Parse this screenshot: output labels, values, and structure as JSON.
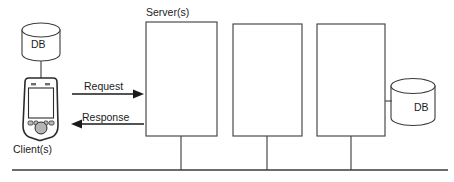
{
  "diagram": {
    "labels": {
      "servers": "Server(s)",
      "clients": "Client(s)",
      "db_left": "DB",
      "db_right": "DB",
      "request": "Request",
      "response": "Response"
    },
    "colors": {
      "stroke": "#3b3b3b",
      "arrow": "#1a1a1a",
      "background": "#ffffff",
      "device_fill": "#ffffff",
      "button_fill": "#b9b9b9"
    },
    "nodes": [
      {
        "id": "db-left",
        "kind": "database",
        "label": "DB",
        "x": 22,
        "y": 20,
        "width": 38,
        "height": 44
      },
      {
        "id": "client",
        "kind": "pda",
        "label": "Client(s)",
        "x": 21,
        "y": 78,
        "width": 40,
        "height": 62
      },
      {
        "id": "server-1",
        "kind": "box",
        "label": "",
        "x": 146,
        "y": 22,
        "width": 71,
        "height": 114
      },
      {
        "id": "server-2",
        "kind": "box",
        "label": "",
        "x": 233,
        "y": 24,
        "width": 69,
        "height": 112
      },
      {
        "id": "server-3",
        "kind": "box",
        "label": "",
        "x": 317,
        "y": 24,
        "width": 68,
        "height": 112
      },
      {
        "id": "db-right",
        "kind": "database",
        "label": "DB",
        "x": 390,
        "y": 78,
        "width": 46,
        "height": 48
      }
    ],
    "edges": [
      {
        "id": "db-left-to-client",
        "from": "db-left",
        "to": "client",
        "kind": "plain"
      },
      {
        "id": "request",
        "from": "client",
        "to": "server-1",
        "kind": "arrow",
        "label": "Request",
        "direction": "right"
      },
      {
        "id": "response",
        "from": "server-1",
        "to": "client",
        "kind": "arrow",
        "label": "Response",
        "direction": "left"
      },
      {
        "id": "server3-to-db",
        "from": "server-3",
        "to": "db-right",
        "kind": "plain"
      },
      {
        "id": "server-1-to-bus",
        "from": "server-1",
        "to": "bus",
        "kind": "plain"
      },
      {
        "id": "server-2-to-bus",
        "from": "server-2",
        "to": "bus",
        "kind": "plain"
      },
      {
        "id": "server-3-to-bus",
        "from": "server-3",
        "to": "bus",
        "kind": "plain"
      }
    ],
    "bus": {
      "id": "network-bus",
      "x1": 12,
      "x2": 448,
      "y": 170
    }
  }
}
